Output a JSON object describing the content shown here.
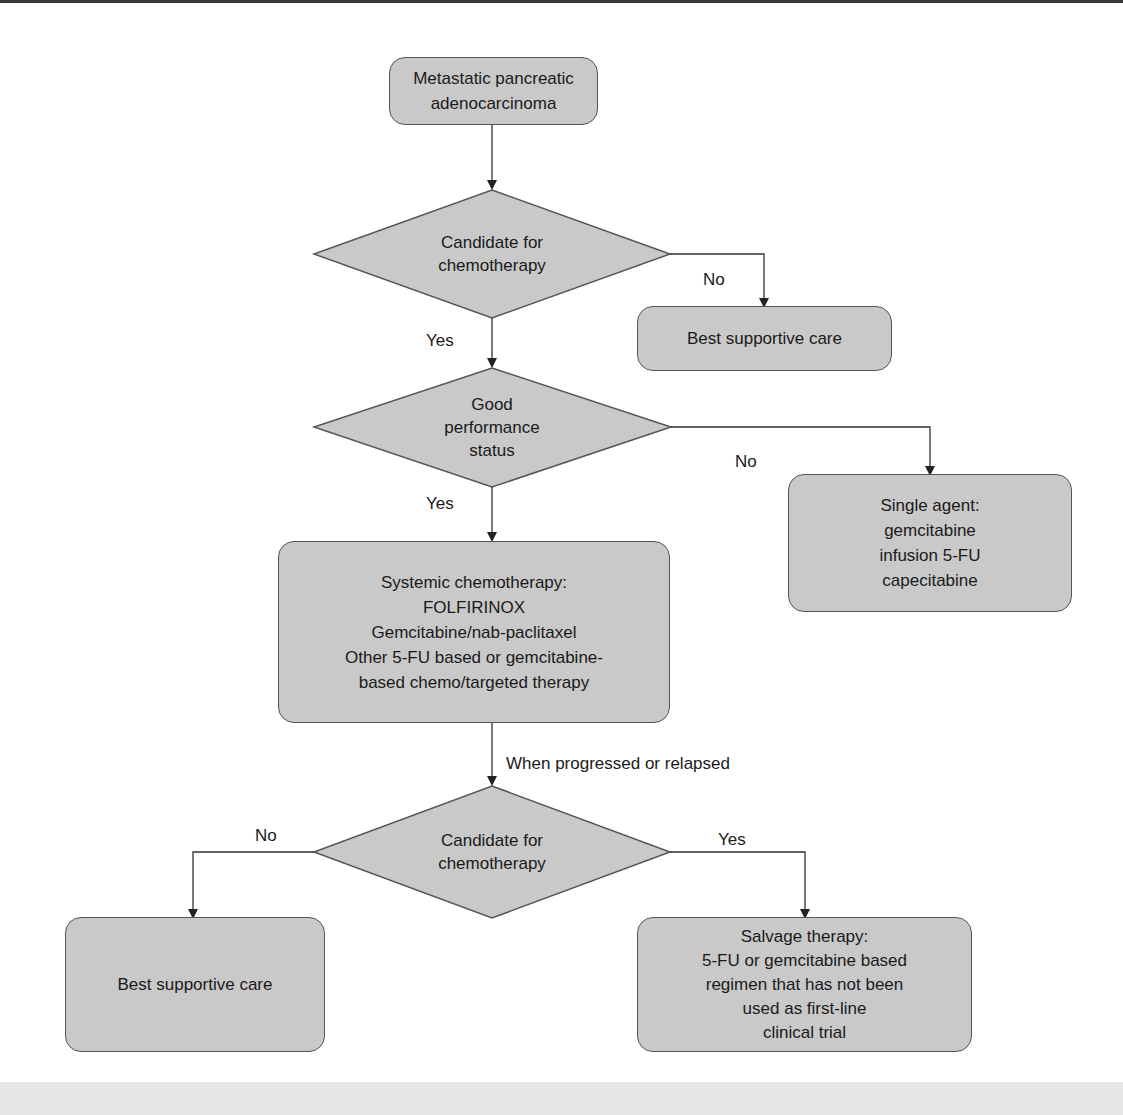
{
  "diagram": {
    "colors": {
      "node_fill": "#c9c9c9",
      "stroke": "#555555",
      "line": "#333333",
      "background": "#ffffff"
    },
    "nodes": {
      "start": {
        "lines": [
          "Metastatic pancreatic",
          "adenocarcinoma"
        ]
      },
      "decision1": {
        "lines": [
          "Candidate for",
          "chemotherapy"
        ]
      },
      "bsc1": {
        "lines": [
          "Best supportive care"
        ]
      },
      "decision2": {
        "lines": [
          "Good",
          "performance",
          "status"
        ]
      },
      "single_agent": {
        "lines": [
          "Single agent:",
          "gemcitabine",
          "infusion 5-FU",
          "capecitabine"
        ]
      },
      "systemic": {
        "lines": [
          "Systemic chemotherapy:",
          "FOLFIRINOX",
          "Gemcitabine/nab-paclitaxel",
          "Other 5-FU based or gemcitabine-",
          "based chemo/targeted therapy"
        ]
      },
      "decision3": {
        "lines": [
          "Candidate for",
          "chemotherapy"
        ]
      },
      "bsc2": {
        "lines": [
          "Best supportive care"
        ]
      },
      "salvage": {
        "lines": [
          "Salvage therapy:",
          "5-FU or gemcitabine based",
          "regimen that has not been",
          "used as first-line",
          "clinical trial"
        ]
      }
    },
    "edge_labels": {
      "d1_no": "No",
      "d1_yes": "Yes",
      "d2_no": "No",
      "d2_yes": "Yes",
      "progression": "When progressed or relapsed",
      "d3_no": "No",
      "d3_yes": "Yes"
    }
  }
}
